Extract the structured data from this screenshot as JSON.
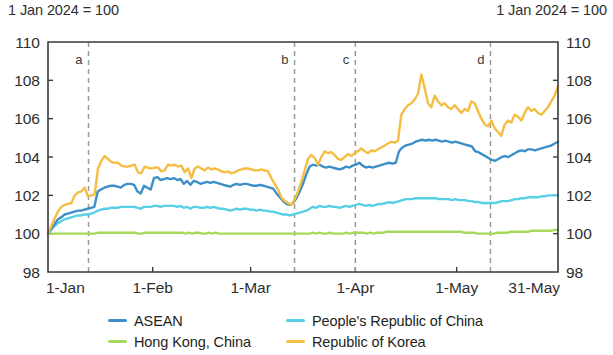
{
  "notes": {
    "left": "1 Jan 2024 = 100",
    "right": "1 Jan 2024 = 100"
  },
  "legend": {
    "items": [
      {
        "label": "ASEAN",
        "color": "#3d8fc9"
      },
      {
        "label": "People's Republic of China",
        "color": "#57cfe6"
      },
      {
        "label": "Hong Kong, China",
        "color": "#a6d95b"
      },
      {
        "label": "Republic of Korea",
        "color": "#f5bd44"
      }
    ]
  },
  "chart_data": {
    "type": "line",
    "title": "",
    "subtitle": "",
    "xlabel": "",
    "ylabel": "",
    "index_note": "1 Jan 2024 = 100",
    "grid": false,
    "legend_position": "bottom",
    "ylim": [
      98,
      110
    ],
    "yticks": [
      98,
      100,
      102,
      104,
      106,
      108,
      110
    ],
    "ytick_labels_left": [
      "98",
      "100",
      "102",
      "104",
      "106",
      "108",
      "110"
    ],
    "ytick_labels_right": [
      "98",
      "100",
      "102",
      "104",
      "106",
      "108",
      "110"
    ],
    "xlim": [
      0,
      151
    ],
    "xticks": [
      0,
      31,
      60,
      91,
      121,
      151
    ],
    "xtick_labels": [
      "1-Jan",
      "1-Feb",
      "1-Mar",
      "1-Apr",
      "1-May",
      "31-May"
    ],
    "annotations": [
      {
        "label": "a",
        "x": 12,
        "type": "vertical-dashed-line"
      },
      {
        "label": "b",
        "x": 73,
        "type": "vertical-dashed-line"
      },
      {
        "label": "c",
        "x": 91,
        "type": "vertical-dashed-line"
      },
      {
        "label": "d",
        "x": 131,
        "type": "vertical-dashed-line"
      }
    ],
    "series": [
      {
        "name": "ASEAN",
        "color": "#3d8fc9",
        "values": [
          100.0,
          100.25,
          100.5,
          100.75,
          100.85,
          101.0,
          101.05,
          101.1,
          101.15,
          101.2,
          101.2,
          101.25,
          101.3,
          101.35,
          101.4,
          102.2,
          102.3,
          102.4,
          102.45,
          102.5,
          102.5,
          102.45,
          102.4,
          102.55,
          102.6,
          102.6,
          102.55,
          102.2,
          102.1,
          102.5,
          102.4,
          102.3,
          102.9,
          102.95,
          102.8,
          102.85,
          102.9,
          102.85,
          102.9,
          102.8,
          102.85,
          102.6,
          102.75,
          102.55,
          102.75,
          102.7,
          102.6,
          102.65,
          102.7,
          102.65,
          102.7,
          102.65,
          102.6,
          102.55,
          102.5,
          102.45,
          102.55,
          102.6,
          102.55,
          102.6,
          102.6,
          102.55,
          102.5,
          102.5,
          102.55,
          102.5,
          102.45,
          102.4,
          102.35,
          102.1,
          101.9,
          101.7,
          101.55,
          101.5,
          101.6,
          101.85,
          102.2,
          102.6,
          103.1,
          103.5,
          103.6,
          103.55,
          103.6,
          103.5,
          103.45,
          103.5,
          103.45,
          103.4,
          103.35,
          103.4,
          103.5,
          103.45,
          103.55,
          103.6,
          103.7,
          103.55,
          103.45,
          103.5,
          103.45,
          103.5,
          103.55,
          103.6,
          103.65,
          103.7,
          103.65,
          103.7,
          104.3,
          104.5,
          104.6,
          104.65,
          104.7,
          104.8,
          104.85,
          104.9,
          104.85,
          104.9,
          104.85,
          104.9,
          104.85,
          104.8,
          104.85,
          104.8,
          104.75,
          104.8,
          104.75,
          104.7,
          104.65,
          104.6,
          104.55,
          104.3,
          104.25,
          104.15,
          104.05,
          103.95,
          103.85,
          103.8,
          103.9,
          104.0,
          104.05,
          104.0,
          104.1,
          104.2,
          104.3,
          104.35,
          104.3,
          104.4,
          104.4,
          104.35,
          104.4,
          104.45,
          104.5,
          104.55,
          104.6,
          104.7,
          104.8
        ]
      },
      {
        "name": "People's Republic of China",
        "color": "#57cfe6",
        "values": [
          100.0,
          100.2,
          100.4,
          100.55,
          100.65,
          100.75,
          100.8,
          100.85,
          100.9,
          100.95,
          100.95,
          101.0,
          101.0,
          101.05,
          101.1,
          101.2,
          101.25,
          101.3,
          101.3,
          101.35,
          101.35,
          101.35,
          101.4,
          101.4,
          101.4,
          101.4,
          101.4,
          101.35,
          101.3,
          101.4,
          101.4,
          101.4,
          101.45,
          101.45,
          101.4,
          101.45,
          101.45,
          101.45,
          101.45,
          101.4,
          101.45,
          101.35,
          101.4,
          101.3,
          101.4,
          101.4,
          101.35,
          101.35,
          101.4,
          101.35,
          101.4,
          101.35,
          101.3,
          101.3,
          101.25,
          101.2,
          101.25,
          101.3,
          101.25,
          101.3,
          101.3,
          101.25,
          101.25,
          101.2,
          101.25,
          101.2,
          101.2,
          101.15,
          101.15,
          101.1,
          101.05,
          101.0,
          101.0,
          100.95,
          101.0,
          101.05,
          101.1,
          101.15,
          101.2,
          101.3,
          101.4,
          101.35,
          101.45,
          101.4,
          101.4,
          101.45,
          101.4,
          101.4,
          101.35,
          101.4,
          101.45,
          101.4,
          101.45,
          101.5,
          101.55,
          101.5,
          101.45,
          101.5,
          101.45,
          101.5,
          101.55,
          101.55,
          101.6,
          101.65,
          101.6,
          101.65,
          101.7,
          101.75,
          101.8,
          101.8,
          101.8,
          101.85,
          101.85,
          101.85,
          101.85,
          101.85,
          101.85,
          101.85,
          101.8,
          101.8,
          101.8,
          101.8,
          101.75,
          101.8,
          101.75,
          101.75,
          101.75,
          101.7,
          101.7,
          101.65,
          101.65,
          101.6,
          101.6,
          101.6,
          101.6,
          101.6,
          101.65,
          101.7,
          101.7,
          101.7,
          101.75,
          101.8,
          101.8,
          101.85,
          101.85,
          101.9,
          101.9,
          101.9,
          101.9,
          101.95,
          101.95,
          102.0,
          102.0,
          102.0,
          102.0
        ]
      },
      {
        "name": "Hong Kong, China",
        "color": "#a6d95b",
        "values": [
          100.0,
          100.0,
          100.0,
          100.0,
          100.0,
          100.0,
          100.0,
          100.0,
          100.0,
          100.0,
          100.0,
          100.0,
          100.0,
          100.0,
          100.0,
          100.05,
          100.05,
          100.05,
          100.05,
          100.05,
          100.05,
          100.05,
          100.05,
          100.05,
          100.05,
          100.05,
          100.05,
          100.0,
          100.0,
          100.05,
          100.05,
          100.05,
          100.05,
          100.05,
          100.05,
          100.05,
          100.05,
          100.05,
          100.05,
          100.05,
          100.05,
          100.0,
          100.05,
          100.0,
          100.05,
          100.05,
          100.0,
          100.0,
          100.05,
          100.0,
          100.05,
          100.0,
          100.0,
          100.0,
          100.0,
          100.0,
          100.0,
          100.0,
          100.0,
          100.0,
          100.0,
          100.0,
          100.0,
          100.0,
          100.0,
          100.0,
          100.0,
          100.0,
          100.0,
          100.0,
          100.0,
          100.0,
          100.0,
          100.0,
          100.0,
          100.0,
          100.0,
          100.0,
          100.0,
          100.05,
          100.0,
          100.05,
          100.0,
          100.0,
          100.05,
          100.0,
          100.0,
          100.0,
          100.0,
          100.05,
          100.0,
          100.05,
          100.05,
          100.05,
          100.05,
          100.0,
          100.05,
          100.0,
          100.05,
          100.05,
          100.05,
          100.1,
          100.1,
          100.1,
          100.1,
          100.1,
          100.1,
          100.1,
          100.1,
          100.1,
          100.1,
          100.1,
          100.1,
          100.1,
          100.1,
          100.1,
          100.1,
          100.1,
          100.1,
          100.1,
          100.1,
          100.1,
          100.1,
          100.1,
          100.05,
          100.05,
          100.05,
          100.05,
          100.0,
          100.0,
          100.0,
          100.0,
          100.0,
          100.0,
          100.05,
          100.05,
          100.05,
          100.05,
          100.1,
          100.1,
          100.1,
          100.1,
          100.1,
          100.1,
          100.15,
          100.15,
          100.15,
          100.15,
          100.15,
          100.15,
          100.15,
          100.2,
          100.2
        ]
      },
      {
        "name": "Republic of Korea",
        "color": "#f5bd44",
        "values": [
          100.0,
          100.4,
          100.8,
          101.15,
          101.4,
          101.5,
          101.55,
          101.6,
          102.0,
          102.15,
          102.2,
          102.4,
          101.95,
          102.0,
          102.05,
          103.4,
          103.8,
          104.05,
          103.9,
          103.75,
          103.7,
          103.7,
          103.55,
          103.5,
          103.5,
          103.55,
          103.6,
          103.2,
          103.15,
          103.5,
          103.45,
          103.4,
          103.45,
          103.45,
          103.25,
          103.3,
          103.6,
          103.55,
          103.6,
          103.5,
          103.55,
          103.2,
          103.4,
          102.9,
          103.4,
          103.5,
          103.4,
          103.3,
          103.45,
          103.35,
          103.4,
          103.35,
          103.25,
          103.2,
          103.25,
          103.15,
          103.2,
          103.3,
          103.35,
          103.4,
          103.4,
          103.35,
          103.3,
          103.3,
          103.35,
          103.3,
          103.25,
          102.9,
          102.6,
          102.3,
          101.9,
          101.7,
          101.6,
          101.5,
          101.8,
          102.2,
          102.7,
          103.3,
          103.9,
          104.1,
          103.95,
          103.6,
          104.0,
          104.3,
          104.2,
          104.25,
          104.1,
          103.9,
          103.85,
          104.0,
          104.15,
          104.05,
          104.2,
          104.3,
          104.45,
          104.3,
          104.2,
          104.35,
          104.3,
          104.4,
          104.5,
          104.6,
          104.7,
          104.8,
          104.75,
          104.85,
          106.2,
          106.5,
          106.7,
          106.8,
          107.0,
          107.3,
          108.3,
          107.6,
          106.8,
          106.6,
          107.2,
          106.9,
          106.7,
          106.8,
          106.6,
          106.5,
          106.7,
          106.5,
          106.3,
          106.5,
          106.4,
          106.9,
          106.8,
          106.4,
          106.0,
          105.7,
          105.6,
          105.9,
          105.5,
          105.3,
          105.1,
          105.7,
          105.9,
          105.8,
          106.2,
          106.1,
          105.9,
          106.3,
          106.6,
          106.4,
          106.5,
          106.3,
          106.2,
          106.4,
          106.6,
          106.9,
          107.2,
          107.7
        ]
      }
    ]
  }
}
